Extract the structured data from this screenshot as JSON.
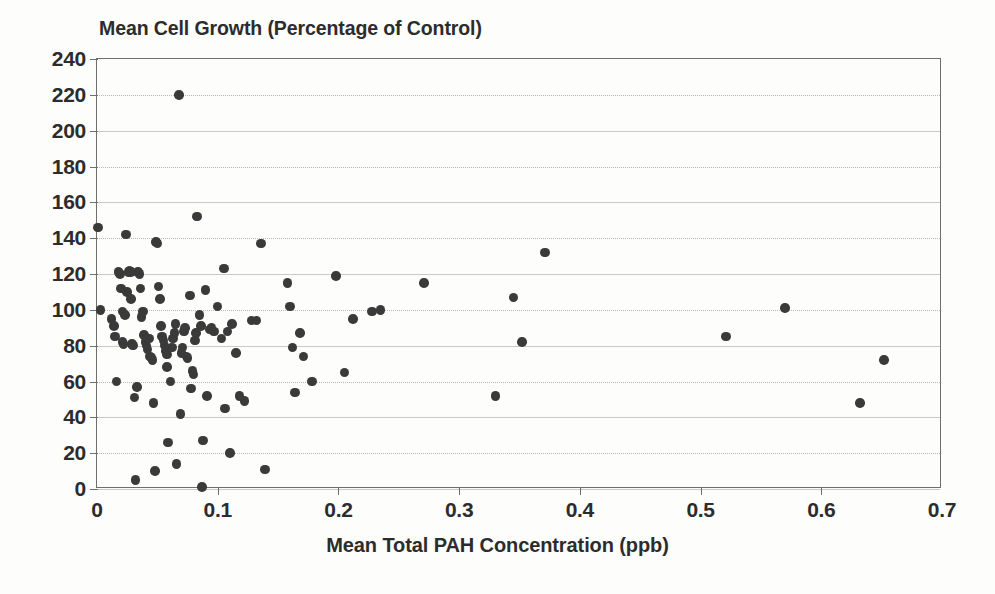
{
  "chart_data": {
    "type": "scatter",
    "title": "Mean Cell Growth (Percentage of Control)",
    "xlabel": "Mean Total PAH Concentration (ppb)",
    "ylabel": "",
    "xlim": [
      0,
      0.7
    ],
    "ylim": [
      0,
      240
    ],
    "xticks": [
      "0",
      "0.1",
      "0.2",
      "0.3",
      "0.4",
      "0.5",
      "0.6",
      "0.7"
    ],
    "xtick_values": [
      0,
      0.1,
      0.2,
      0.3,
      0.4,
      0.5,
      0.6,
      0.7
    ],
    "yticks": [
      "0",
      "20",
      "40",
      "60",
      "80",
      "100",
      "120",
      "140",
      "160",
      "180",
      "200",
      "220",
      "240"
    ],
    "ytick_values": [
      0,
      20,
      40,
      60,
      80,
      100,
      120,
      140,
      160,
      180,
      200,
      220,
      240
    ],
    "grid": true,
    "grid_axis": "y",
    "legend": false,
    "marker_color": "#3a3a3a",
    "points": [
      [
        0.001,
        146
      ],
      [
        0.003,
        100
      ],
      [
        0.012,
        95
      ],
      [
        0.014,
        91
      ],
      [
        0.015,
        85
      ],
      [
        0.016,
        60
      ],
      [
        0.018,
        121
      ],
      [
        0.019,
        120
      ],
      [
        0.02,
        112
      ],
      [
        0.021,
        99
      ],
      [
        0.021,
        82
      ],
      [
        0.022,
        81
      ],
      [
        0.023,
        97
      ],
      [
        0.024,
        142
      ],
      [
        0.025,
        110
      ],
      [
        0.026,
        121
      ],
      [
        0.027,
        122
      ],
      [
        0.028,
        121
      ],
      [
        0.028,
        106
      ],
      [
        0.029,
        81
      ],
      [
        0.03,
        80
      ],
      [
        0.031,
        51
      ],
      [
        0.032,
        5
      ],
      [
        0.033,
        57
      ],
      [
        0.034,
        121
      ],
      [
        0.035,
        120
      ],
      [
        0.036,
        112
      ],
      [
        0.037,
        96
      ],
      [
        0.038,
        99
      ],
      [
        0.039,
        86
      ],
      [
        0.04,
        82
      ],
      [
        0.041,
        80
      ],
      [
        0.042,
        78
      ],
      [
        0.043,
        84
      ],
      [
        0.044,
        74
      ],
      [
        0.045,
        73
      ],
      [
        0.046,
        72
      ],
      [
        0.047,
        48
      ],
      [
        0.048,
        10
      ],
      [
        0.049,
        138
      ],
      [
        0.05,
        137
      ],
      [
        0.051,
        113
      ],
      [
        0.052,
        106
      ],
      [
        0.053,
        91
      ],
      [
        0.054,
        85
      ],
      [
        0.055,
        83
      ],
      [
        0.056,
        80
      ],
      [
        0.057,
        77
      ],
      [
        0.058,
        75
      ],
      [
        0.058,
        68
      ],
      [
        0.059,
        26
      ],
      [
        0.061,
        60
      ],
      [
        0.062,
        79
      ],
      [
        0.063,
        84
      ],
      [
        0.064,
        87
      ],
      [
        0.065,
        92
      ],
      [
        0.066,
        14
      ],
      [
        0.068,
        220
      ],
      [
        0.069,
        42
      ],
      [
        0.07,
        76
      ],
      [
        0.071,
        79
      ],
      [
        0.072,
        88
      ],
      [
        0.073,
        90
      ],
      [
        0.074,
        74
      ],
      [
        0.075,
        73
      ],
      [
        0.077,
        108
      ],
      [
        0.078,
        56
      ],
      [
        0.079,
        66
      ],
      [
        0.08,
        64
      ],
      [
        0.081,
        83
      ],
      [
        0.082,
        87
      ],
      [
        0.083,
        152
      ],
      [
        0.085,
        97
      ],
      [
        0.086,
        91
      ],
      [
        0.087,
        1
      ],
      [
        0.088,
        27
      ],
      [
        0.09,
        111
      ],
      [
        0.091,
        52
      ],
      [
        0.093,
        89
      ],
      [
        0.095,
        90
      ],
      [
        0.097,
        88
      ],
      [
        0.1,
        102
      ],
      [
        0.103,
        84
      ],
      [
        0.105,
        123
      ],
      [
        0.106,
        45
      ],
      [
        0.108,
        88
      ],
      [
        0.11,
        20
      ],
      [
        0.112,
        92
      ],
      [
        0.115,
        76
      ],
      [
        0.118,
        52
      ],
      [
        0.122,
        49
      ],
      [
        0.128,
        94
      ],
      [
        0.132,
        94
      ],
      [
        0.136,
        137
      ],
      [
        0.139,
        11
      ],
      [
        0.158,
        115
      ],
      [
        0.16,
        102
      ],
      [
        0.162,
        79
      ],
      [
        0.164,
        54
      ],
      [
        0.168,
        87
      ],
      [
        0.171,
        74
      ],
      [
        0.178,
        60
      ],
      [
        0.198,
        119
      ],
      [
        0.205,
        65
      ],
      [
        0.212,
        95
      ],
      [
        0.228,
        99
      ],
      [
        0.235,
        100
      ],
      [
        0.271,
        115
      ],
      [
        0.33,
        52
      ],
      [
        0.345,
        107
      ],
      [
        0.352,
        82
      ],
      [
        0.371,
        132
      ],
      [
        0.521,
        85
      ],
      [
        0.57,
        101
      ],
      [
        0.632,
        48
      ],
      [
        0.652,
        72
      ]
    ]
  },
  "figure": {
    "background_color": "#fdfdfc",
    "axis_color": "#6e6e6e",
    "text_color": "#2c2c2c",
    "grid_color": "#b8b8b8"
  }
}
